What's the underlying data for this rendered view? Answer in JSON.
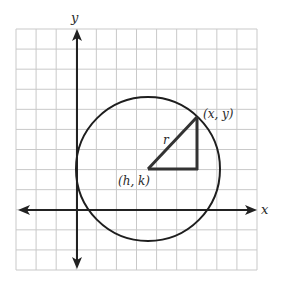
{
  "diagram": {
    "type": "circle-on-coordinate-grid",
    "grid": {
      "columns": 12,
      "rows": 12
    },
    "axes": {
      "x_label": "x",
      "y_label": "y"
    },
    "labels": {
      "center": "(h, k)",
      "point": "(x, y)",
      "radius": "r"
    },
    "colors": {
      "grid": "#c9c9c9",
      "axis": "#222222",
      "circle": "#1e1e1e",
      "triangle": "#333333"
    }
  }
}
